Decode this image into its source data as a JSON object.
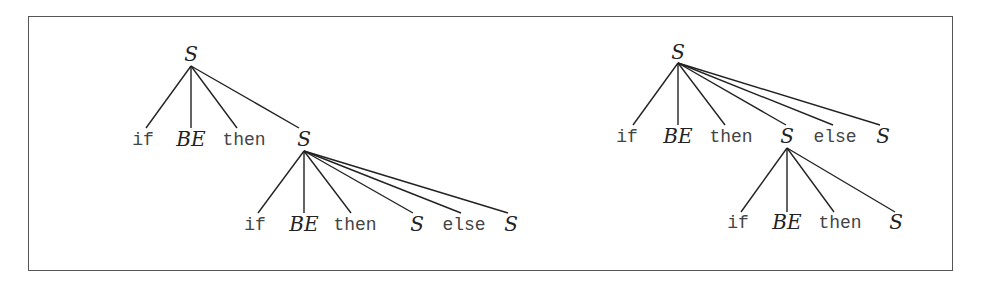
{
  "diagram": {
    "title": "",
    "trees": [
      {
        "name": "left-parse-tree",
        "nodes": [
          {
            "id": "L0",
            "label": "S",
            "kind": "nonterminal",
            "x": 191,
            "y": 44
          },
          {
            "id": "L1",
            "label": "if",
            "kind": "terminal",
            "x": 143,
            "y": 131
          },
          {
            "id": "L2",
            "label": "BE",
            "kind": "nonterminal",
            "x": 191,
            "y": 129
          },
          {
            "id": "L3",
            "label": "then",
            "kind": "terminal",
            "x": 244,
            "y": 131
          },
          {
            "id": "L4",
            "label": "S",
            "kind": "nonterminal",
            "x": 304,
            "y": 129
          },
          {
            "id": "L5",
            "label": "if",
            "kind": "terminal",
            "x": 255,
            "y": 216
          },
          {
            "id": "L6",
            "label": "BE",
            "kind": "nonterminal",
            "x": 304,
            "y": 214
          },
          {
            "id": "L7",
            "label": "then",
            "kind": "terminal",
            "x": 355,
            "y": 216
          },
          {
            "id": "L8",
            "label": "S",
            "kind": "nonterminal",
            "x": 417,
            "y": 214
          },
          {
            "id": "L9",
            "label": "else",
            "kind": "terminal",
            "x": 464,
            "y": 216
          },
          {
            "id": "L10",
            "label": "S",
            "kind": "nonterminal",
            "x": 511,
            "y": 214
          }
        ],
        "edges": [
          {
            "from": [
              191,
              66
            ],
            "to": [
              146,
              128
            ]
          },
          {
            "from": [
              191,
              66
            ],
            "to": [
              191,
              128
            ]
          },
          {
            "from": [
              191,
              66
            ],
            "to": [
              237,
              128
            ]
          },
          {
            "from": [
              191,
              66
            ],
            "to": [
              299,
              128
            ]
          },
          {
            "from": [
              304,
              151
            ],
            "to": [
              258,
              213
            ]
          },
          {
            "from": [
              304,
              151
            ],
            "to": [
              304,
              213
            ]
          },
          {
            "from": [
              304,
              151
            ],
            "to": [
              351,
              213
            ]
          },
          {
            "from": [
              304,
              151
            ],
            "to": [
              413,
              213
            ]
          },
          {
            "from": [
              304,
              151
            ],
            "to": [
              461,
              213
            ]
          },
          {
            "from": [
              304,
              151
            ],
            "to": [
              508,
              213
            ]
          }
        ]
      },
      {
        "name": "right-parse-tree",
        "nodes": [
          {
            "id": "R0",
            "label": "S",
            "kind": "nonterminal",
            "x": 678,
            "y": 42
          },
          {
            "id": "R1",
            "label": "if",
            "kind": "terminal",
            "x": 627,
            "y": 128
          },
          {
            "id": "R2",
            "label": "BE",
            "kind": "nonterminal",
            "x": 678,
            "y": 126
          },
          {
            "id": "R3",
            "label": "then",
            "kind": "terminal",
            "x": 731,
            "y": 128
          },
          {
            "id": "R4",
            "label": "S",
            "kind": "nonterminal",
            "x": 787,
            "y": 126
          },
          {
            "id": "R5",
            "label": "else",
            "kind": "terminal",
            "x": 835,
            "y": 128
          },
          {
            "id": "R6",
            "label": "S",
            "kind": "nonterminal",
            "x": 883,
            "y": 126
          },
          {
            "id": "R7",
            "label": "if",
            "kind": "terminal",
            "x": 738,
            "y": 214
          },
          {
            "id": "R8",
            "label": "BE",
            "kind": "nonterminal",
            "x": 787,
            "y": 212
          },
          {
            "id": "R9",
            "label": "then",
            "kind": "terminal",
            "x": 840,
            "y": 214
          },
          {
            "id": "R10",
            "label": "S",
            "kind": "nonterminal",
            "x": 896,
            "y": 212
          }
        ],
        "edges": [
          {
            "from": [
              678,
              63
            ],
            "to": [
              633,
              125
            ]
          },
          {
            "from": [
              678,
              63
            ],
            "to": [
              678,
              125
            ]
          },
          {
            "from": [
              678,
              63
            ],
            "to": [
              725,
              125
            ]
          },
          {
            "from": [
              678,
              63
            ],
            "to": [
              786,
              125
            ]
          },
          {
            "from": [
              678,
              63
            ],
            "to": [
              833,
              125
            ]
          },
          {
            "from": [
              678,
              63
            ],
            "to": [
              880,
              125
            ]
          },
          {
            "from": [
              787,
              148
            ],
            "to": [
              741,
              212
            ]
          },
          {
            "from": [
              787,
              148
            ],
            "to": [
              787,
              212
            ]
          },
          {
            "from": [
              787,
              148
            ],
            "to": [
              834,
              212
            ]
          },
          {
            "from": [
              787,
              148
            ],
            "to": [
              895,
              212
            ]
          }
        ]
      }
    ]
  },
  "colors": {
    "line": "#222222",
    "frame": "#555555",
    "text": "#333333"
  }
}
